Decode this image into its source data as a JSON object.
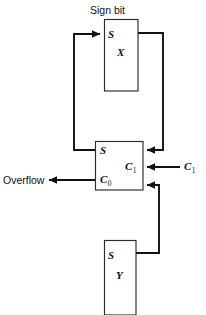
{
  "diagram": {
    "background_color": "#ffffff",
    "line_color": "#111111",
    "box_stroke_color": "#2b2b2b",
    "labels": {
      "sign_bit": "Sign bit",
      "overflow": "Overflow",
      "carry_in_external": "C",
      "carry_in_external_sub": "1"
    },
    "blocks": [
      {
        "id": "register-x",
        "name": "X",
        "port_label": "S",
        "body_label": "X",
        "caption": "Sign bit",
        "x": 104,
        "y": 19,
        "width": 34,
        "height": 72
      },
      {
        "id": "full-adder",
        "name": "Full adder",
        "port_label_top_left": "S",
        "port_label_bottom_left": "C",
        "port_label_bottom_left_sub": "0",
        "port_label_right": "C",
        "port_label_right_sub": "1",
        "x": 95,
        "y": 141,
        "width": 48,
        "height": 49
      },
      {
        "id": "register-y",
        "name": "Y",
        "port_label": "S",
        "body_label": "Y",
        "x": 104,
        "y": 240,
        "width": 32,
        "height": 75
      }
    ],
    "signals": [
      {
        "id": "sum-feedback-to-x",
        "from": "full-adder.S",
        "to": "register-x.S",
        "label": ""
      },
      {
        "id": "x-out-to-adder",
        "from": "register-x.out",
        "to": "full-adder.in-top",
        "label": ""
      },
      {
        "id": "y-out-to-adder",
        "from": "register-y.out",
        "to": "full-adder.in-bottom",
        "label": ""
      },
      {
        "id": "carry-in",
        "from": "external",
        "to": "full-adder.C1",
        "label": "C1"
      },
      {
        "id": "overflow-out",
        "from": "full-adder.C0",
        "to": "external",
        "label": "Overflow"
      }
    ]
  }
}
